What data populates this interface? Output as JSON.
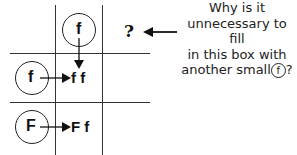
{
  "grid": {
    "top_circle": "f",
    "row1_circle": "f",
    "row1_result": "f f",
    "row2_circle": "F",
    "row2_result": "F f",
    "question_mark": "?"
  },
  "note": {
    "line1": "Why is it",
    "line2": "unnecessary to fill",
    "line3": "in this box with",
    "line4_prefix": "another small",
    "line4_circled": "f",
    "line4_suffix": "?"
  }
}
